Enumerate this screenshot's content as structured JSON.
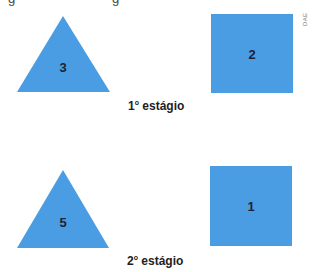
{
  "figure": {
    "credit": "DAE",
    "fill_color": "#4a9de3",
    "top_cut_text": [
      "g",
      "g"
    ],
    "stages": [
      {
        "label_num": "1",
        "label_ord": "o",
        "label_text": " estágio",
        "triangle_value": "3",
        "square_value": "2"
      },
      {
        "label_num": "2",
        "label_ord": "o",
        "label_text": " estágio",
        "triangle_value": "5",
        "square_value": "1"
      }
    ]
  }
}
